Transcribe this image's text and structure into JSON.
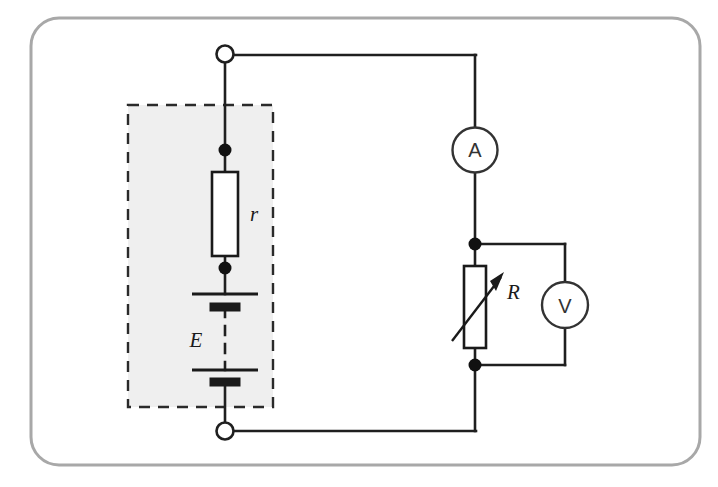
{
  "figure": {
    "kind": "electrical-circuit-schematic",
    "title_text": "",
    "frame": {
      "border_color": "#a8a8a8",
      "background_color": "#ffffff",
      "corner_radius": 28
    }
  },
  "colors": {
    "wire": "#1f1f1f",
    "component_outline": "#1a1a1a",
    "component_fill": "#ffffff",
    "source_box_fill": "#efefef",
    "source_box_dash": "#2a2a2a",
    "frame_border": "#a8a8a8",
    "node_dot": "#111111",
    "meter_outline": "#333333",
    "terminal_fill": "#ffffff"
  },
  "source_block": {
    "name": "emf-source-dashed-region",
    "note": "dashed shaded rectangle enclosing internal resistance r and cell stack E"
  },
  "components": [
    {
      "id": "terminal-top",
      "type": "open-terminal",
      "label": ""
    },
    {
      "id": "terminal-bottom",
      "type": "open-terminal",
      "label": ""
    },
    {
      "id": "resistor-r",
      "type": "fixed-resistor",
      "label": "r",
      "meaning": "internal resistance"
    },
    {
      "id": "battery-e",
      "type": "battery-cells",
      "label": "E",
      "meaning": "electromotive force",
      "cell_count": 2
    },
    {
      "id": "ammeter",
      "type": "ammeter",
      "label": "A",
      "meaning": "current meter"
    },
    {
      "id": "rheostat-R",
      "type": "variable-resistor",
      "label": "R",
      "meaning": "external variable load resistance"
    },
    {
      "id": "voltmeter",
      "type": "voltmeter",
      "label": "V",
      "meaning": "potential difference meter"
    }
  ],
  "labels": {
    "internal_resistance": "r",
    "emf": "E",
    "ammeter": "A",
    "variable_resistance": "R",
    "voltmeter": "V"
  }
}
